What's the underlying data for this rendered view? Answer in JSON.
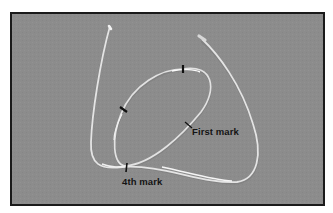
{
  "figure": {
    "background_color": "#8c8c8c",
    "border_color": "#1a1a1a",
    "tube_color": "#e6e6e6",
    "mark_color": "#111111",
    "annotations": [
      {
        "id": "first",
        "label": "First mark"
      },
      {
        "id": "fourth",
        "label": "4th mark"
      }
    ]
  }
}
